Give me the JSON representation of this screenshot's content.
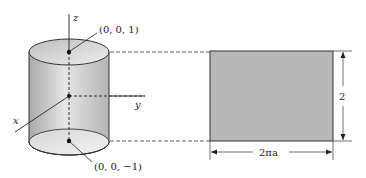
{
  "diagram": {
    "cylinder": {
      "axes": {
        "z": "z",
        "y": "y",
        "x": "x"
      },
      "points": [
        {
          "label": "(0, 0, 1)"
        },
        {
          "label": "(0, 0, −1)"
        }
      ]
    },
    "unrolled_rectangle": {
      "height_label": "2",
      "width_label": "2πa"
    },
    "colors": {
      "cylinder_fill": "#c8c8c8",
      "rectangle_fill": "#b8b8b8",
      "stroke": "#333333"
    }
  }
}
